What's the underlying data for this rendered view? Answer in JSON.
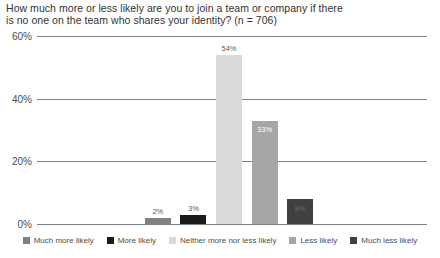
{
  "chart_data": {
    "type": "bar",
    "title": "How much more or less likely are you to join a team or company if there is no one on the team who shares your identity? (n = 706)",
    "title_lines": [
      "How much more or less likely are you to join a team or company if there",
      "is no one on the team who shares your identity? (n = 706)"
    ],
    "xlabel": "",
    "ylabel": "",
    "ylim": [
      0,
      60
    ],
    "grid": true,
    "legend_position": "bottom",
    "ytick_labels": [
      "0%",
      "20%",
      "40%",
      "60%"
    ],
    "ytick_values": [
      0,
      20,
      40,
      60
    ],
    "categories": [
      "Much more likely",
      "More likely",
      "Neither more nor less likely",
      "Less likely",
      "Much less likely"
    ],
    "values": [
      2,
      3,
      54,
      33,
      8
    ],
    "data_labels": [
      "2%",
      "3%",
      "54%",
      "33%",
      "8%"
    ],
    "colors": [
      "#808080",
      "#1a1a1a",
      "#d9d9d9",
      "#a6a6a6",
      "#404040"
    ],
    "sample_size": 706
  },
  "legend": {
    "items": [
      {
        "label": "Much more likely",
        "color": "#808080"
      },
      {
        "label": "More likely",
        "color": "#1a1a1a"
      },
      {
        "label": "Neither more nor less likely",
        "color": "#d9d9d9"
      },
      {
        "label": "Less likely",
        "color": "#a6a6a6"
      },
      {
        "label": "Much less likely",
        "color": "#404040"
      }
    ]
  },
  "style": {
    "gridline_color": "#808080",
    "background": "#ffffff",
    "title_color": "#333333",
    "tick_color": "#4d4d4d"
  }
}
